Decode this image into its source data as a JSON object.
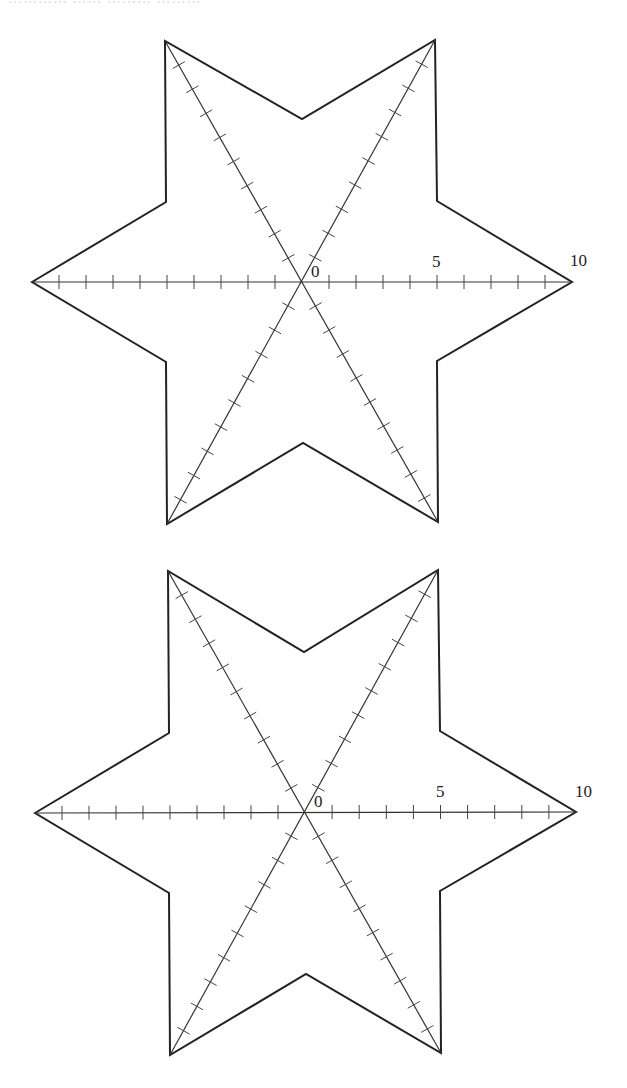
{
  "page": {
    "cutoff_text": "………… …… ……… ………"
  },
  "figures": [
    {
      "id": "star-top",
      "offset_y": 0,
      "center": [
        302,
        282
      ],
      "unit_px": 27,
      "outer_vertices": [
        [
          32,
          282
        ],
        [
          165,
          41
        ],
        [
          435,
          40
        ],
        [
          572,
          282
        ],
        [
          438,
          522
        ],
        [
          167,
          524
        ]
      ],
      "inner_vertices": [
        [
          166,
          202
        ],
        [
          302,
          119
        ],
        [
          437,
          201
        ],
        [
          437,
          361
        ],
        [
          303,
          443
        ],
        [
          166,
          362
        ]
      ],
      "axes": [
        {
          "from": [
            32,
            282
          ],
          "to": [
            572,
            282
          ]
        },
        {
          "from": [
            165,
            41
          ],
          "to": [
            438,
            522
          ]
        },
        {
          "from": [
            435,
            40
          ],
          "to": [
            167,
            524
          ]
        }
      ],
      "labels": [
        {
          "text": "0",
          "x": 311,
          "y": 277
        },
        {
          "text": "5",
          "x": 432,
          "y": 267
        },
        {
          "text": "10",
          "x": 570,
          "y": 266
        }
      ]
    },
    {
      "id": "star-bottom",
      "offset_y": 0,
      "center": [
        305,
        812
      ],
      "unit_px": 27,
      "outer_vertices": [
        [
          35,
          813
        ],
        [
          168,
          571
        ],
        [
          438,
          570
        ],
        [
          576,
          812
        ],
        [
          441,
          1053
        ],
        [
          170,
          1055
        ]
      ],
      "inner_vertices": [
        [
          169,
          733
        ],
        [
          304,
          652
        ],
        [
          440,
          731
        ],
        [
          440,
          891
        ],
        [
          306,
          974
        ],
        [
          169,
          893
        ]
      ],
      "axes": [
        {
          "from": [
            35,
            813
          ],
          "to": [
            576,
            812
          ]
        },
        {
          "from": [
            168,
            571
          ],
          "to": [
            441,
            1053
          ]
        },
        {
          "from": [
            438,
            570
          ],
          "to": [
            170,
            1055
          ]
        }
      ],
      "labels": [
        {
          "text": "0",
          "x": 314,
          "y": 807
        },
        {
          "text": "5",
          "x": 436,
          "y": 797
        },
        {
          "text": "10",
          "x": 575,
          "y": 797
        }
      ]
    }
  ],
  "axis_scale": {
    "min": 0,
    "max": 10,
    "ticks_per_half_axis": 9,
    "labeled_ticks": [
      "0",
      "5",
      "10"
    ]
  }
}
